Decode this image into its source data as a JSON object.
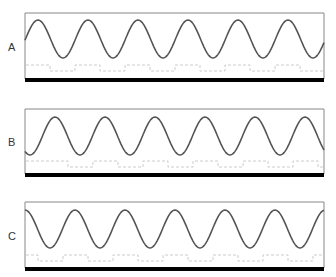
{
  "figure": {
    "panels": [
      {
        "label": "A",
        "label_x": 8,
        "label_y": 41,
        "box": {
          "x": 25,
          "y": 13,
          "w": 299,
          "h": 66
        },
        "wave": {
          "period": 50,
          "first_peak_x": 38,
          "peak_y": 20,
          "trough_y": 58
        },
        "step_line": {
          "y_high": 65,
          "y_low": 71,
          "period": 50,
          "first_drop_x": 50
        },
        "bar": {
          "y": 78,
          "h": 4
        }
      },
      {
        "label": "B",
        "label_x": 8,
        "label_y": 136,
        "box": {
          "x": 25,
          "y": 109,
          "w": 299,
          "h": 65
        },
        "wave": {
          "period": 50,
          "first_peak_x": 55,
          "peak_y": 117,
          "trough_y": 155
        },
        "step_line": {
          "y_high": 161,
          "y_low": 167,
          "period": 50,
          "first_drop_x": 68
        },
        "bar": {
          "y": 173,
          "h": 4
        }
      },
      {
        "label": "C",
        "label_x": 8,
        "label_y": 230,
        "box": {
          "x": 25,
          "y": 202,
          "w": 299,
          "h": 66
        },
        "wave": {
          "period": 50,
          "first_peak_x": 25,
          "peak_y": 210,
          "trough_y": 248
        },
        "step_line": {
          "y_high": 255,
          "y_low": 261,
          "period": 50,
          "first_drop_x": 38
        },
        "bar": {
          "y": 267,
          "h": 4
        }
      }
    ],
    "colors": {
      "wave": "#555555",
      "box": "#888888",
      "bar": "#000000",
      "step": "#cccccc"
    }
  }
}
